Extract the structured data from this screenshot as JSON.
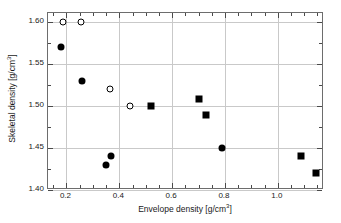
{
  "chart_data": {
    "type": "scatter",
    "title": "",
    "xlabel": "Envelope density [g/cm3]",
    "ylabel": "Skeletal density [g/cm3]",
    "xlabel_base": "Envelope density [g/cm",
    "xlabel_exp": "3",
    "xlabel_tail": "]",
    "ylabel_base": "Skeletal density [g/cm",
    "ylabel_exp": "3",
    "ylabel_tail": "]",
    "xlim": [
      0.13,
      1.175
    ],
    "ylim": [
      1.4,
      1.611
    ],
    "xticks": [
      0.2,
      0.4,
      0.6,
      0.8,
      1.0
    ],
    "xtick_labels": [
      "0.2",
      "0.4",
      "0.6",
      "0.8",
      "1.0"
    ],
    "xminor_ticks": [
      0.15,
      0.25,
      0.3,
      0.35,
      0.45,
      0.5,
      0.55,
      0.65,
      0.7,
      0.75,
      0.85,
      0.9,
      0.95,
      1.05,
      1.1,
      1.15
    ],
    "yticks": [
      1.4,
      1.45,
      1.5,
      1.55,
      1.6
    ],
    "ytick_labels": [
      "1.40",
      "1.45",
      "1.50",
      "1.55",
      "1.60"
    ],
    "yminor_ticks": [
      1.425,
      1.475,
      1.525,
      1.575
    ],
    "grid": true,
    "grid_color": "#c9c9c9",
    "frame_color": "#6d6d6d",
    "marker_color": "#000000",
    "legend": "none",
    "series": [
      {
        "name": "open-circle",
        "marker": "circle-open",
        "points": [
          {
            "x": 0.185,
            "y": 1.6
          },
          {
            "x": 0.255,
            "y": 1.6
          },
          {
            "x": 0.365,
            "y": 1.52
          },
          {
            "x": 0.44,
            "y": 1.5
          }
        ]
      },
      {
        "name": "filled-circle",
        "marker": "circle-filled",
        "points": [
          {
            "x": 0.18,
            "y": 1.57
          },
          {
            "x": 0.258,
            "y": 1.53
          },
          {
            "x": 0.348,
            "y": 1.43
          },
          {
            "x": 0.37,
            "y": 1.44
          },
          {
            "x": 0.79,
            "y": 1.45
          }
        ]
      },
      {
        "name": "filled-square",
        "marker": "square-filled",
        "points": [
          {
            "x": 0.52,
            "y": 1.5
          },
          {
            "x": 0.703,
            "y": 1.508
          },
          {
            "x": 0.728,
            "y": 1.49
          },
          {
            "x": 1.088,
            "y": 1.44
          },
          {
            "x": 1.145,
            "y": 1.42
          }
        ]
      }
    ]
  }
}
